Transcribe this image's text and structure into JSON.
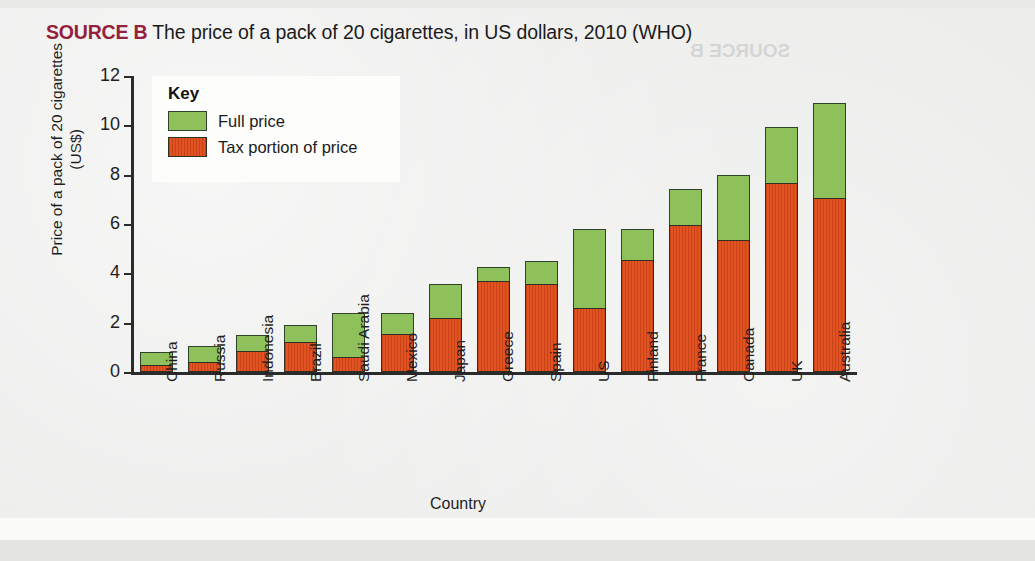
{
  "title": {
    "source_label": "SOURCE B",
    "text": " The price of a pack of 20 cigarettes, in US dollars, 2010 (WHO)",
    "ghost_text": "SOURCE B",
    "source_color": "#95203c"
  },
  "legend": {
    "title": "Key",
    "items": [
      {
        "label": "Full price",
        "color": "#8ec05c",
        "swatch": "green-swatch"
      },
      {
        "label": "Tax portion of price",
        "color": "#e04a18",
        "swatch": "red-swatch"
      }
    ]
  },
  "chart_data": {
    "type": "bar",
    "subtype": "stacked-overlay",
    "title": "The price of a pack of 20 cigarettes, in US dollars, 2010 (WHO)",
    "xlabel": "Country",
    "ylabel": "Price of a pack of 20 cigarettes (US$)",
    "ylim": [
      0,
      12
    ],
    "yticks": [
      0,
      2,
      4,
      6,
      8,
      10,
      12
    ],
    "ytick_labels": [
      "0",
      "2",
      "4",
      "6",
      "8",
      "10",
      "12"
    ],
    "grid": false,
    "legend_position": "top-left-inside",
    "categories": [
      "China",
      "Russia",
      "Indonesia",
      "Brazil",
      "Saudi Arabia",
      "Mexico",
      "Japan",
      "Greece",
      "Spain",
      "US",
      "Finland",
      "France",
      "Canada",
      "UK",
      "Australia"
    ],
    "series": [
      {
        "name": "Full price",
        "color": "#8ec05c",
        "values": [
          0.8,
          1.05,
          1.5,
          1.9,
          2.4,
          2.4,
          3.55,
          4.25,
          4.5,
          5.8,
          5.8,
          7.4,
          8.0,
          9.95,
          10.9
        ]
      },
      {
        "name": "Tax portion of price",
        "color": "#e04a18",
        "values": [
          0.28,
          0.4,
          0.85,
          1.2,
          0.6,
          1.55,
          2.2,
          3.7,
          3.55,
          2.6,
          4.55,
          5.95,
          5.35,
          7.65,
          7.05
        ]
      }
    ],
    "units": "US$"
  }
}
